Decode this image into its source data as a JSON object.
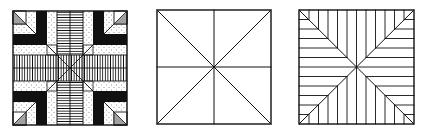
{
  "figure": {
    "colors": {
      "ink": "#111111",
      "paper": "#ffffff",
      "stipple": "#333333"
    },
    "panels": [
      {
        "id": "patterned-block",
        "label": "Filled pattern block with black L-shapes, stippled bands, hatched cross bands and hatched corner triangles",
        "x": 13,
        "y": 11,
        "size": 114
      },
      {
        "id": "divided-square",
        "label": "Square divided into eight triangles by diagonals and midlines",
        "x": 157,
        "y": 10,
        "size": 114
      },
      {
        "id": "line-block",
        "label": "Square with diagonals and parallel ruled lines in each quadrant region",
        "x": 299,
        "y": 10,
        "size": 115
      }
    ]
  }
}
